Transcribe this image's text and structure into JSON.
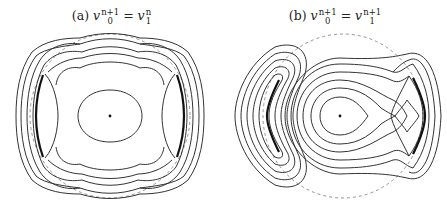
{
  "figure": {
    "panels": [
      {
        "id": "a",
        "label": "(a)",
        "lhs_var": "v",
        "lhs_sub": "0",
        "lhs_sup": "n+1",
        "equals": "=",
        "rhs_var": "v",
        "rhs_sub": "1",
        "rhs_sup": "n",
        "description": "Level curves with symmetric saddle structure; central elliptic fixed point, two thick arcs at left/right; dashed unit circle"
      },
      {
        "id": "b",
        "label": "(b)",
        "lhs_var": "v",
        "lhs_sub": "0",
        "lhs_sup": "n+1",
        "equals": "=",
        "rhs_var": "v",
        "rhs_sub": "1",
        "rhs_sup": "n+1",
        "description": "Level curves: left crescent-shaped closed curves, central nested closed curves around fixed point with saddle on right; dashed unit circle"
      }
    ],
    "colors": {
      "curve": "#333333",
      "dashed_circle": "#888888",
      "background": "#ffffff"
    }
  }
}
